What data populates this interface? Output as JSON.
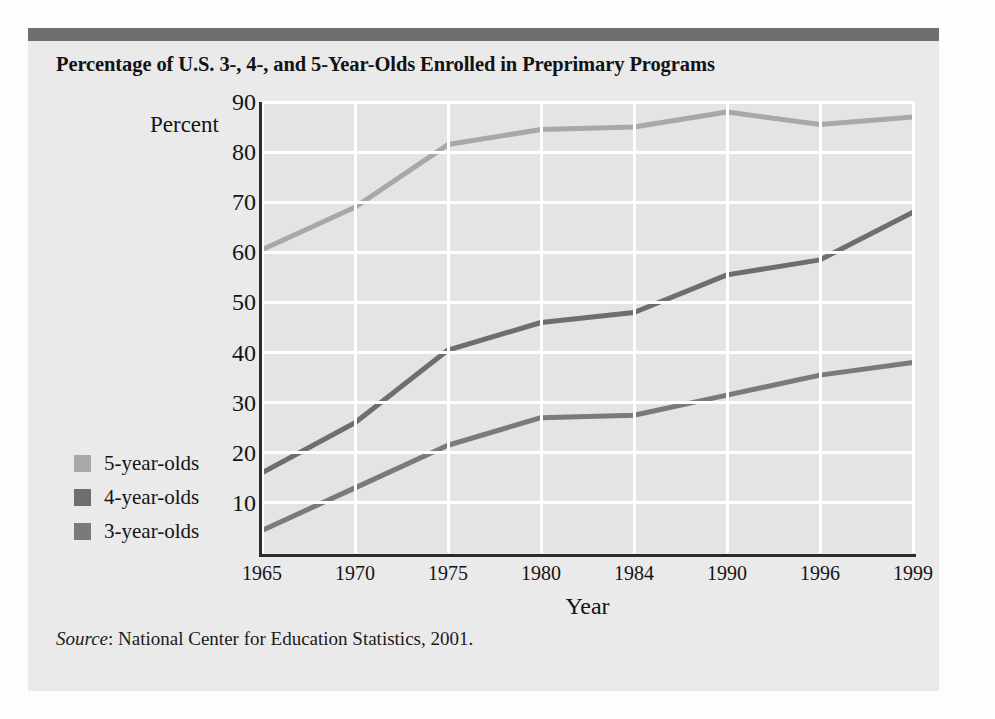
{
  "figure": {
    "title": "Percentage of U.S. 3-, 4-, and 5-Year-Olds Enrolled in Preprimary Programs",
    "source_word": "Source",
    "source_text": ": National Center for Education Statistics, 2001."
  },
  "legend": {
    "items": [
      {
        "label": "5-year-olds",
        "color": "#a8a8a8"
      },
      {
        "label": "4-year-olds",
        "color": "#6e6e6e"
      },
      {
        "label": "3-year-olds",
        "color": "#7a7a7a"
      }
    ]
  },
  "colors": {
    "panel_background": "#eaeaea",
    "plot_background": "#e4e4e4",
    "gridline": "#ffffff",
    "axis": "#2b2b2b",
    "top_rule": "#6f6f6f",
    "series_5yo": "#a8a8a8",
    "series_4yo": "#6e6e6e",
    "series_3yo": "#7a7a7a"
  },
  "chart_data": {
    "type": "line",
    "title": "Percentage of U.S. 3-, 4-, and 5-Year-Olds Enrolled in Preprimary Programs",
    "xlabel": "Year",
    "ylabel": "Percent",
    "categories": [
      "1965",
      "1970",
      "1975",
      "1980",
      "1984",
      "1990",
      "1996",
      "1999"
    ],
    "ylim": [
      0,
      90
    ],
    "yticks": [
      10,
      20,
      30,
      40,
      50,
      60,
      70,
      80,
      90
    ],
    "grid": true,
    "legend_position": "left-outside",
    "series": [
      {
        "name": "5-year-olds",
        "color": "#a8a8a8",
        "values": [
          60.5,
          69.0,
          81.5,
          84.5,
          85.0,
          88.0,
          85.5,
          87.0
        ]
      },
      {
        "name": "4-year-olds",
        "color": "#6e6e6e",
        "values": [
          16.0,
          26.0,
          40.5,
          46.0,
          48.0,
          55.5,
          58.5,
          68.0
        ]
      },
      {
        "name": "3-year-olds",
        "color": "#7a7a7a",
        "values": [
          4.5,
          13.0,
          21.5,
          27.0,
          27.5,
          31.5,
          35.5,
          38.0
        ]
      }
    ]
  }
}
